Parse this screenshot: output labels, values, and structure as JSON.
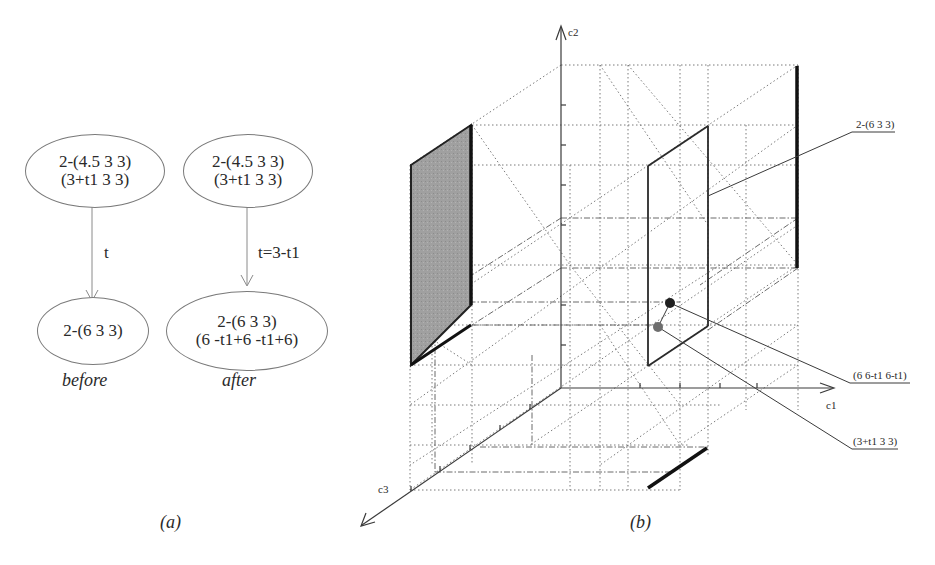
{
  "panel_a": {
    "caption": "(a)",
    "before": {
      "label": "before",
      "top_node": {
        "line1": "2-(4.5 3 3)",
        "line2": "(3+t1 3 3)"
      },
      "edge_label": "t",
      "bottom_node": {
        "line1": "2-(6 3 3)"
      }
    },
    "after": {
      "label": "after",
      "top_node": {
        "line1": "2-(4.5 3 3)",
        "line2": "(3+t1 3 3)"
      },
      "edge_label": "t=3-t1",
      "bottom_node": {
        "line1": "2-(6 3 3)",
        "line2": "(6 -t1+6 -t1+6)"
      }
    }
  },
  "panel_b": {
    "caption": "(b)",
    "axes": {
      "c1": "c1",
      "c2": "c2",
      "c3": "c3"
    },
    "annotations": {
      "plane_label": "2-(6 3 3)",
      "point_dark_label": "(6 6-t1 6-t1)",
      "point_light_label": "(3+t1 3 3)"
    },
    "colors": {
      "shaded_face": "#9a9a9a",
      "point_dark": "#1e1e1e",
      "point_light": "#6e6e6e"
    }
  }
}
